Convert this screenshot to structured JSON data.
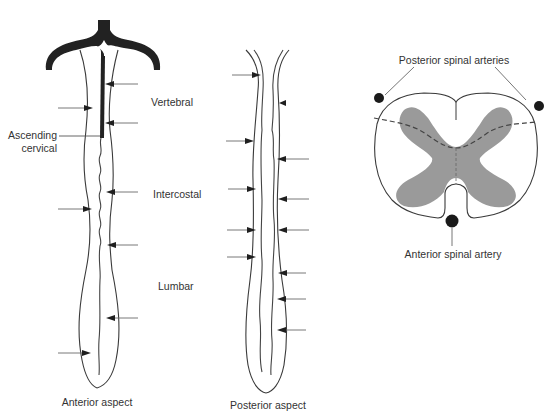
{
  "figure": {
    "panels": [
      {
        "id": "anterior",
        "caption": "Anterior aspect",
        "arterial_labels": [
          "Vertebral",
          "Intercostal",
          "Lumbar"
        ],
        "side_label": "Ascending cervical"
      },
      {
        "id": "posterior",
        "caption": "Posterior aspect"
      },
      {
        "id": "cross-section",
        "top_label": "Posterior spinal arteries",
        "bottom_label": "Anterior spinal artery"
      }
    ],
    "labels": {
      "vertebral": "Vertebral",
      "intercostal": "Intercostal",
      "lumbar": "Lumbar",
      "ascending_line1": "Ascending",
      "ascending_line2": "cervical",
      "anterior_caption": "Anterior aspect",
      "posterior_caption": "Posterior aspect",
      "posterior_arteries": "Posterior spinal arteries",
      "anterior_artery": "Anterior spinal artery"
    },
    "colors": {
      "vessel_dark": "#222222",
      "grey_matter": "#9a9a9a",
      "outline": "#3a3a3a",
      "artery_dot": "#1a1a1a"
    }
  }
}
